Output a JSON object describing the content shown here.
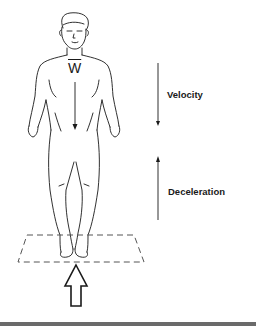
{
  "diagram": {
    "weight_label": "W",
    "velocity_label": "Velocity",
    "deceleration_label": "Deceleration",
    "elements": [
      {
        "name": "human-figure",
        "description": "standing person, front view"
      },
      {
        "name": "weight-vector",
        "direction": "down"
      },
      {
        "name": "velocity-arrow",
        "direction": "down"
      },
      {
        "name": "deceleration-arrow",
        "direction": "up"
      },
      {
        "name": "ground-plate",
        "style": "dashed parallelogram"
      },
      {
        "name": "ground-reaction-arrow",
        "direction": "up",
        "style": "hollow block arrow"
      }
    ]
  },
  "colors": {
    "line": "#1a1a1a",
    "dash": "#555555",
    "band": "#6a6a6a"
  }
}
